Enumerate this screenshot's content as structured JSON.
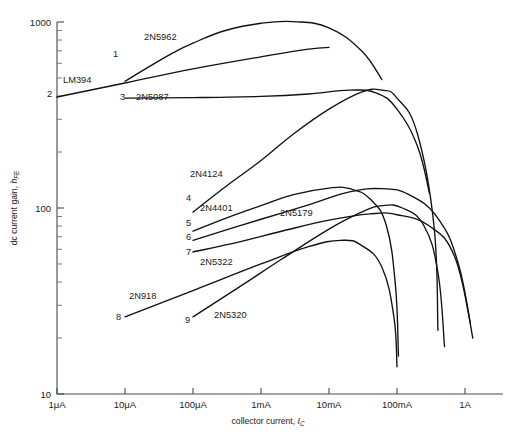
{
  "figure": {
    "background": "#ffffff",
    "ink_color": "#111111",
    "axis_color": "#4a4a4a"
  },
  "chart_data": {
    "type": "line",
    "title": "",
    "xlabel": "collector current, I",
    "xlabel_sub": "C",
    "ylabel": "dc current gain, h",
    "ylabel_sub": "FE",
    "xscale": "log",
    "yscale": "log",
    "xlim": [
      1e-06,
      2.0
    ],
    "ylim": [
      10,
      1000
    ],
    "grid": false,
    "legend": "inline-curve-labels",
    "xticks": [
      {
        "value": 1e-06,
        "label": "1μA"
      },
      {
        "value": 1e-05,
        "label": "10μA"
      },
      {
        "value": 0.0001,
        "label": "100μA"
      },
      {
        "value": 0.001,
        "label": "1mA"
      },
      {
        "value": 0.01,
        "label": "10mA"
      },
      {
        "value": 0.1,
        "label": "100mA"
      },
      {
        "value": 1.0,
        "label": "1A"
      }
    ],
    "yticks": [
      {
        "value": 1000,
        "label": "1000"
      },
      {
        "value": 100,
        "label": "100"
      },
      {
        "value": 10,
        "label": "10"
      }
    ],
    "series": [
      {
        "index": "1",
        "name": "2N5962",
        "points": [
          [
            1e-05,
            480
          ],
          [
            2e-05,
            560
          ],
          [
            5e-05,
            680
          ],
          [
            0.0001,
            770
          ],
          [
            0.0003,
            900
          ],
          [
            0.001,
            985
          ],
          [
            0.003,
            1005
          ],
          [
            0.01,
            930
          ],
          [
            0.03,
            700
          ],
          [
            0.06,
            490
          ]
        ]
      },
      {
        "index": "2",
        "name": "LM394",
        "points": [
          [
            1e-06,
            395
          ],
          [
            1e-05,
            470
          ],
          [
            0.0001,
            560
          ],
          [
            0.001,
            650
          ],
          [
            0.005,
            715
          ],
          [
            0.01,
            730
          ]
        ]
      },
      {
        "index": "3",
        "name": "2N5087",
        "points": [
          [
            1e-05,
            390
          ],
          [
            0.0001,
            392
          ],
          [
            0.001,
            398
          ],
          [
            0.005,
            410
          ],
          [
            0.02,
            430
          ],
          [
            0.05,
            415
          ],
          [
            0.1,
            340
          ],
          [
            0.2,
            215
          ],
          [
            0.3,
            120
          ]
        ]
      },
      {
        "index": "4",
        "name": "2N4124",
        "points": [
          [
            0.0001,
            95
          ],
          [
            0.0003,
            130
          ],
          [
            0.001,
            180
          ],
          [
            0.003,
            250
          ],
          [
            0.01,
            340
          ],
          [
            0.03,
            420
          ],
          [
            0.06,
            430
          ],
          [
            0.1,
            390
          ],
          [
            0.2,
            250
          ],
          [
            0.35,
            80
          ],
          [
            0.4,
            22
          ]
        ]
      },
      {
        "index": "5",
        "name": "2N4401",
        "points": [
          [
            0.0001,
            75
          ],
          [
            0.0003,
            88
          ],
          [
            0.001,
            103
          ],
          [
            0.003,
            118
          ],
          [
            0.01,
            128
          ],
          [
            0.02,
            127
          ],
          [
            0.04,
            112
          ],
          [
            0.07,
            80
          ],
          [
            0.095,
            38
          ],
          [
            0.105,
            16
          ]
        ]
      },
      {
        "index": "6",
        "name": "2N5179",
        "points": [
          [
            0.0001,
            67
          ],
          [
            0.0003,
            76
          ],
          [
            0.001,
            87
          ],
          [
            0.005,
            104
          ],
          [
            0.02,
            122
          ],
          [
            0.06,
            127
          ],
          [
            0.15,
            118
          ],
          [
            0.4,
            88
          ],
          [
            0.8,
            50
          ],
          [
            1.3,
            20
          ]
        ]
      },
      {
        "index": "7",
        "name": "2N5322",
        "points": [
          [
            0.0001,
            58
          ],
          [
            0.0005,
            66
          ],
          [
            0.002,
            75
          ],
          [
            0.01,
            86
          ],
          [
            0.04,
            93
          ],
          [
            0.1,
            92
          ],
          [
            0.3,
            80
          ],
          [
            0.7,
            55
          ],
          [
            1.2,
            24
          ]
        ]
      },
      {
        "index": "8",
        "name": "2N918",
        "points": [
          [
            1e-05,
            26
          ],
          [
            0.0001,
            36
          ],
          [
            0.001,
            50
          ],
          [
            0.005,
            62
          ],
          [
            0.015,
            67
          ],
          [
            0.03,
            63
          ],
          [
            0.06,
            48
          ],
          [
            0.09,
            26
          ],
          [
            0.1,
            14
          ]
        ]
      },
      {
        "index": "9",
        "name": "2N5320",
        "points": [
          [
            0.0001,
            26
          ],
          [
            0.0005,
            38
          ],
          [
            0.002,
            53
          ],
          [
            0.01,
            77
          ],
          [
            0.03,
            95
          ],
          [
            0.06,
            103
          ],
          [
            0.12,
            100
          ],
          [
            0.25,
            80
          ],
          [
            0.4,
            45
          ],
          [
            0.5,
            18
          ]
        ]
      }
    ],
    "annotations": [
      {
        "id": "1",
        "name": "2N5962",
        "index_x": 113,
        "index_y": 57,
        "label_x": 144,
        "label_y": 40
      },
      {
        "id": "2",
        "name": "LM394",
        "index_x": 47,
        "index_y": 97,
        "label_x": 63,
        "label_y": 83
      },
      {
        "id": "3",
        "name": "2N5087",
        "index_x": 120,
        "index_y": 100,
        "label_x": 136,
        "label_y": 100
      },
      {
        "id": "4",
        "name": "2N4124",
        "index_x": 186,
        "index_y": 201,
        "label_x": 190,
        "label_y": 177
      },
      {
        "id": "5",
        "name": "2N4401",
        "index_x": 186,
        "index_y": 226,
        "label_x": 200,
        "label_y": 211
      },
      {
        "id": "6",
        "name": "2N5179",
        "index_x": 186,
        "index_y": 240,
        "label_x": 280,
        "label_y": 216
      },
      {
        "id": "7",
        "name": "2N5322",
        "index_x": 186,
        "index_y": 255,
        "label_x": 200,
        "label_y": 265
      },
      {
        "id": "8",
        "name": "2N918",
        "index_x": 116,
        "index_y": 320,
        "label_x": 129,
        "label_y": 299
      },
      {
        "id": "9",
        "name": "2N5320",
        "index_x": 185,
        "index_y": 323,
        "label_x": 214,
        "label_y": 318
      }
    ]
  }
}
